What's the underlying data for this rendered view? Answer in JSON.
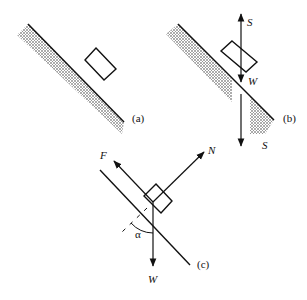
{
  "diagram": {
    "colors": {
      "line": "#111111",
      "hatch": "#9a9a9a",
      "background": "#ffffff"
    },
    "panels": [
      {
        "id": "a",
        "label": "(a)"
      },
      {
        "id": "b",
        "label": "(b)",
        "forces": {
          "up": "S",
          "weight": "W",
          "down": "S"
        }
      },
      {
        "id": "c",
        "label": "(c)",
        "forces": {
          "friction": "F",
          "normal": "N",
          "weight": "W"
        },
        "angle": "α"
      }
    ]
  }
}
